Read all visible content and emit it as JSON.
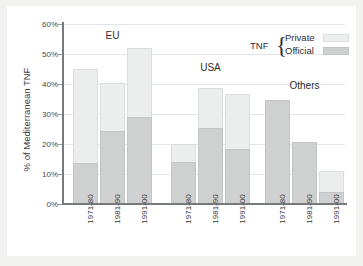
{
  "figure": {
    "background_color": "#f2f2f0",
    "card_color": "#ffffff"
  },
  "legend": {
    "title": "TNF",
    "brace": "{",
    "entries": [
      {
        "label": "Private",
        "color": "#eceded"
      },
      {
        "label": "Official",
        "color": "#cfd1d1"
      }
    ]
  },
  "chart_data": {
    "type": "bar",
    "subtype": "grouped-stacked-bar",
    "title": "",
    "xlabel": "",
    "ylabel": "% of Mediterranean TNF",
    "ylim": [
      0,
      60
    ],
    "ytick_labels": [
      "0%",
      "10%",
      "20%",
      "30%",
      "40%",
      "50%",
      "60%"
    ],
    "ytick_values": [
      0,
      10,
      20,
      30,
      40,
      50,
      60
    ],
    "grid": true,
    "grid_axis": "y",
    "legend_position": "top-right",
    "group_labels": [
      "EU",
      "USA",
      "Others"
    ],
    "categories": [
      "1971-80",
      "1981-90",
      "1991-00"
    ],
    "series": [
      {
        "name": "Official",
        "color": "#cfd1d1",
        "stack_position": "bottom",
        "values_by_group": {
          "EU": [
            13.7,
            24.2,
            29.1
          ],
          "USA": [
            14.0,
            25.4,
            18.5
          ],
          "Others": [
            34.8,
            20.7,
            4.1
          ]
        }
      },
      {
        "name": "Private",
        "color": "#eceded",
        "stack_position": "top",
        "values_by_group": {
          "EU": [
            31.3,
            16.0,
            22.9
          ],
          "USA": [
            6.0,
            13.2,
            18.2
          ],
          "Others": [
            0.0,
            0.0,
            6.9
          ]
        }
      }
    ],
    "totals_by_group": {
      "EU": [
        45.0,
        40.2,
        52.0
      ],
      "USA": [
        20.0,
        38.6,
        36.7
      ],
      "Others": [
        34.8,
        20.7,
        11.0
      ]
    },
    "bars": [
      {
        "group": "EU",
        "category": "1971-80",
        "official": 13.7,
        "private": 31.3,
        "total": 45.0
      },
      {
        "group": "EU",
        "category": "1981-90",
        "official": 24.2,
        "private": 16.0,
        "total": 40.2
      },
      {
        "group": "EU",
        "category": "1991-00",
        "official": 29.1,
        "private": 22.9,
        "total": 52.0
      },
      {
        "group": "USA",
        "category": "1971-80",
        "official": 14.0,
        "private": 6.0,
        "total": 20.0
      },
      {
        "group": "USA",
        "category": "1981-90",
        "official": 25.4,
        "private": 13.2,
        "total": 38.6
      },
      {
        "group": "USA",
        "category": "1991-00",
        "official": 18.5,
        "private": 18.2,
        "total": 36.7
      },
      {
        "group": "Others",
        "category": "1971-80",
        "official": 34.8,
        "private": 0.0,
        "total": 34.8
      },
      {
        "group": "Others",
        "category": "1981-90",
        "official": 20.7,
        "private": 0.0,
        "total": 20.7
      },
      {
        "group": "Others",
        "category": "1991-00",
        "official": 4.1,
        "private": 6.9,
        "total": 11.0
      }
    ]
  }
}
